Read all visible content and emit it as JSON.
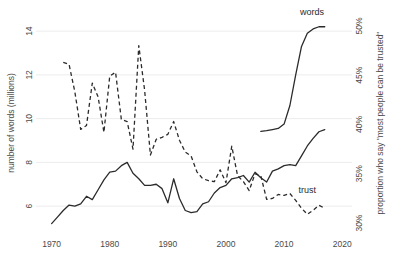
{
  "chart_data": {
    "type": "line",
    "title": "",
    "xlabel": "",
    "ylabel": "number of words (millions)",
    "y2label": "proportion who say \"most people can be trusted\"",
    "xlim": [
      1968,
      2021
    ],
    "ylim": [
      5.0,
      14.6
    ],
    "y2lim": [
      29.5,
      50.8
    ],
    "grid": true,
    "legend_position": "inline-end-of-line",
    "x_ticks": [
      "1970",
      "1980",
      "1990",
      "2000",
      "2010",
      "2020"
    ],
    "x_tick_values": [
      1970,
      1980,
      1990,
      2000,
      2010,
      2020
    ],
    "y_ticks": [
      "6",
      "8",
      "10",
      "12",
      "14"
    ],
    "y_tick_values": [
      6,
      8,
      10,
      12,
      14
    ],
    "y2_ticks": [
      "30%",
      "35%",
      "40%",
      "45%",
      "50%"
    ],
    "y2_tick_values": [
      30,
      35,
      40,
      45,
      50
    ],
    "series": [
      {
        "name": "words",
        "label": "words",
        "style": "solid",
        "axis": "left",
        "unit": "millions of words",
        "x": [
          1970,
          1971,
          1972,
          1973,
          1974,
          1975,
          1976,
          1977,
          1978,
          1979,
          1980,
          1981,
          1982,
          1983,
          1984,
          1985,
          1986,
          1987,
          1988,
          1989,
          1990,
          1991,
          1992,
          1993,
          1994,
          1995,
          1996,
          1997,
          1998,
          1999,
          2000,
          2001,
          2002,
          2003,
          2004,
          2005,
          2006,
          2007,
          2008,
          2009,
          2010,
          2011,
          2012,
          2013,
          2014,
          2015,
          2016,
          2017
        ],
        "values": [
          5.2,
          5.5,
          5.8,
          6.05,
          6.0,
          6.1,
          6.45,
          6.3,
          6.75,
          7.2,
          7.55,
          7.6,
          7.85,
          8.0,
          7.5,
          7.25,
          6.95,
          6.95,
          7.0,
          6.8,
          6.15,
          7.25,
          6.35,
          5.8,
          5.7,
          5.75,
          6.1,
          6.2,
          6.6,
          6.85,
          6.95,
          7.25,
          7.3,
          7.4,
          7.1,
          7.55,
          7.3,
          7.1,
          7.6,
          7.7,
          7.85,
          7.9,
          7.85,
          8.3,
          8.75,
          9.1,
          9.4,
          9.5
        ]
      },
      {
        "name": "words_continued",
        "label": "",
        "style": "solid",
        "axis": "left",
        "x": [
          2006,
          2007,
          2008,
          2009,
          2010,
          2011,
          2012,
          2013,
          2014,
          2015,
          2016,
          2017
        ],
        "values": [
          9.42,
          9.45,
          9.5,
          9.55,
          9.75,
          10.6,
          12.0,
          13.3,
          13.9,
          14.1,
          14.2,
          14.2
        ]
      },
      {
        "name": "trust",
        "label": "trust",
        "style": "dashed",
        "axis": "right",
        "unit": "percent",
        "x": [
          1972,
          1973,
          1974,
          1975,
          1976,
          1977,
          1978,
          1979,
          1980,
          1981,
          1982,
          1983,
          1984,
          1985,
          1986,
          1987,
          1988,
          1989,
          1990,
          1991,
          1992,
          1993,
          1994,
          1995,
          1996,
          1997,
          1998,
          1999,
          2000,
          2001,
          2002,
          2003,
          2004,
          2005,
          2006,
          2007,
          2008,
          2009,
          2010,
          2011,
          2012,
          2013,
          2014,
          2015,
          2016,
          2017
        ],
        "values": [
          46.3,
          46.1,
          43.3,
          39.5,
          39.9,
          44.2,
          42.8,
          39.2,
          44.9,
          45.3,
          40.5,
          40.3,
          37.5,
          48.0,
          43.5,
          36.9,
          38.5,
          38.7,
          39.0,
          40.3,
          38.4,
          37.2,
          36.8,
          35.2,
          34.5,
          34.3,
          34.2,
          35.4,
          34.1,
          37.8,
          34.8,
          34.2,
          33.3,
          35.0,
          34.8,
          32.4,
          32.5,
          32.9,
          32.8,
          33.0,
          32.3,
          31.5,
          30.9,
          31.3,
          31.8,
          31.5
        ]
      }
    ],
    "annotations": [
      {
        "text": "words",
        "x": 2014.8,
        "y_left": 14.75,
        "series": "words"
      },
      {
        "text": "trust",
        "x": 2014.0,
        "y_right": 33.0,
        "series": "trust"
      }
    ]
  },
  "colors": {
    "line": "#2b2b2b",
    "grid": "#ececec",
    "text": "#4a4a4a",
    "background": "#ffffff"
  }
}
